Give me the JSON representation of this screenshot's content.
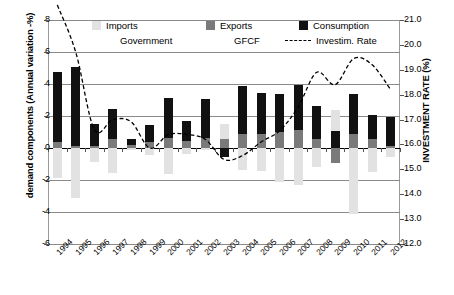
{
  "axes": {
    "left_title": "demand components (Annual variation -%)",
    "right_title": "INVESTMENT RATE (%)",
    "left_ticks": [
      "8",
      "6",
      "4",
      "2",
      "0",
      "-2",
      "-4",
      "-6"
    ],
    "right_ticks": [
      "21.0",
      "20.0",
      "19.0",
      "18.0",
      "17.0",
      "16.0",
      "15.0",
      "14.0",
      "13.0",
      "12.0"
    ]
  },
  "legend": {
    "items": [
      {
        "label": "Imports",
        "marker": "swatch",
        "color": "#e2e2e2"
      },
      {
        "label": "Exports",
        "marker": "swatch",
        "color": "#7a7a7a"
      },
      {
        "label": "Consumption",
        "marker": "swatch",
        "color": "#111111"
      },
      {
        "label": "Government",
        "marker": "swatch",
        "color": "#ffffff"
      },
      {
        "label": "GFCF",
        "marker": "swatch",
        "color": "#ffffff"
      },
      {
        "label": "Investim. Rate",
        "marker": "dashed-line",
        "color": "#000000"
      }
    ]
  },
  "chart_data": {
    "type": "bar",
    "title": "",
    "xlabel": "",
    "ylabel": "demand components (Annual variation -%)",
    "y2label": "INVESTMENT RATE (%)",
    "ylim": [
      -6,
      8
    ],
    "y2lim": [
      12.0,
      21.0
    ],
    "grid": true,
    "legend_position": "top",
    "stacked": true,
    "categories": [
      "1994",
      "1995",
      "1996",
      "1997",
      "1998",
      "1999",
      "2000",
      "2001",
      "2002",
      "2003",
      "2004",
      "2005",
      "2006",
      "2007",
      "2008",
      "2009",
      "2010",
      "2011",
      "2012"
    ],
    "series": [
      {
        "name": "Consumption",
        "color": "#111111",
        "values": [
          4.4,
          4.9,
          1.4,
          1.9,
          0.35,
          1.1,
          2.5,
          1.25,
          2.4,
          -0.55,
          3.0,
          2.6,
          2.4,
          2.85,
          2.1,
          1.05,
          2.5,
          1.5,
          1.8
        ]
      },
      {
        "name": "Exports",
        "color": "#7a7a7a",
        "values": [
          0.35,
          0.15,
          0.1,
          0.55,
          0.2,
          0.35,
          0.6,
          0.45,
          0.65,
          0.55,
          0.85,
          0.85,
          1.0,
          1.1,
          0.55,
          -0.95,
          0.85,
          0.55,
          0.15
        ]
      },
      {
        "name": "Imports",
        "color": "#e2e2e2",
        "values": [
          -1.9,
          -3.1,
          -0.85,
          -1.55,
          -0.1,
          -0.45,
          -1.6,
          -0.35,
          -0.1,
          0.95,
          -1.35,
          -1.45,
          -2.1,
          -2.3,
          -1.2,
          1.3,
          -4.1,
          -1.5,
          -0.55
        ]
      },
      {
        "name": "Government",
        "color": "#ffffff",
        "values": [
          0,
          0,
          0,
          0,
          0,
          0,
          0,
          0,
          0,
          0,
          0,
          0,
          0,
          0,
          0,
          0,
          0,
          0,
          0
        ]
      },
      {
        "name": "GFCF",
        "color": "#ffffff",
        "values": [
          0,
          0,
          0,
          0,
          0,
          0,
          0,
          0,
          0,
          0,
          0,
          0,
          0,
          0,
          0,
          0,
          0,
          0,
          0
        ]
      }
    ],
    "line_series": {
      "name": "Investim. Rate",
      "axis": "right",
      "style": "dashed",
      "color": "#000000",
      "values": [
        21.6,
        19.7,
        16.6,
        17.0,
        16.9,
        15.85,
        16.4,
        16.4,
        16.2,
        15.4,
        15.55,
        16.1,
        16.55,
        17.5,
        18.9,
        18.4,
        19.45,
        19.2,
        18.2
      ]
    }
  }
}
